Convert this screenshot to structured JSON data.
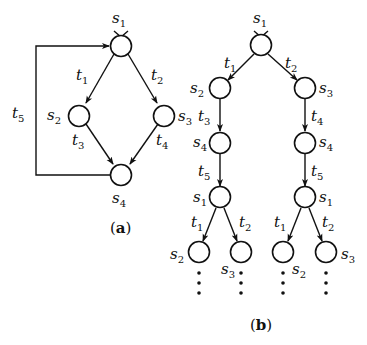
{
  "figure_a": {
    "caption_open": "(",
    "caption_letter": "a",
    "caption_close": ")",
    "nodes": [
      {
        "id": "s1",
        "name": "s",
        "sub": "1"
      },
      {
        "id": "s2",
        "name": "s",
        "sub": "2"
      },
      {
        "id": "s3",
        "name": "s",
        "sub": "3"
      },
      {
        "id": "s4",
        "name": "s",
        "sub": "4"
      }
    ],
    "edges": [
      {
        "id": "t1",
        "name": "t",
        "sub": "1",
        "from": "s1",
        "to": "s2"
      },
      {
        "id": "t2",
        "name": "t",
        "sub": "2",
        "from": "s1",
        "to": "s3"
      },
      {
        "id": "t3",
        "name": "t",
        "sub": "3",
        "from": "s2",
        "to": "s4"
      },
      {
        "id": "t4",
        "name": "t",
        "sub": "4",
        "from": "s3",
        "to": "s4"
      },
      {
        "id": "t5",
        "name": "t",
        "sub": "5",
        "from": "s4",
        "to": "s1"
      }
    ]
  },
  "figure_b": {
    "caption_open": "(",
    "caption_letter": "b",
    "caption_close": ")",
    "root": {
      "name": "s",
      "sub": "1"
    },
    "left_branch": {
      "edge1": {
        "name": "t",
        "sub": "1"
      },
      "node1": {
        "name": "s",
        "sub": "2"
      },
      "edge2": {
        "name": "t",
        "sub": "3"
      },
      "node2": {
        "name": "s",
        "sub": "4"
      },
      "edge3": {
        "name": "t",
        "sub": "5"
      },
      "node3": {
        "name": "s",
        "sub": "1"
      },
      "leaf_edges": [
        {
          "name": "t",
          "sub": "1"
        },
        {
          "name": "t",
          "sub": "2"
        }
      ],
      "leaves": [
        {
          "name": "s",
          "sub": "2"
        },
        {
          "name": "s",
          "sub": "3"
        }
      ]
    },
    "right_branch": {
      "edge1": {
        "name": "t",
        "sub": "2"
      },
      "node1": {
        "name": "s",
        "sub": "3"
      },
      "edge2": {
        "name": "t",
        "sub": "4"
      },
      "node2": {
        "name": "s",
        "sub": "4"
      },
      "edge3": {
        "name": "t",
        "sub": "5"
      },
      "node3": {
        "name": "s",
        "sub": "1"
      },
      "leaf_edges": [
        {
          "name": "t",
          "sub": "1"
        },
        {
          "name": "t",
          "sub": "2"
        }
      ],
      "leaves": [
        {
          "name": "s",
          "sub": "2"
        },
        {
          "name": "s",
          "sub": "3"
        }
      ]
    },
    "continuation": "⋮"
  }
}
